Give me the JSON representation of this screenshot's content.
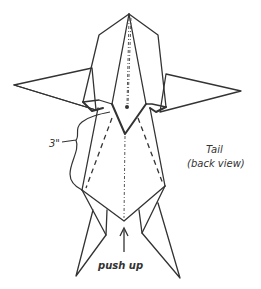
{
  "diagram": {
    "type": "origami fold instruction",
    "subject": "Tail (back view)",
    "labels": {
      "title": "Tail",
      "subtitle": "(back view)",
      "measurement": "3\"",
      "instruction": "push up"
    },
    "line_styles": {
      "solid": "edge",
      "dashed": "valley fold",
      "dash_dot": "mountain fold / center line"
    },
    "colors": {
      "stroke": "#333333",
      "background": "#ffffff"
    }
  }
}
